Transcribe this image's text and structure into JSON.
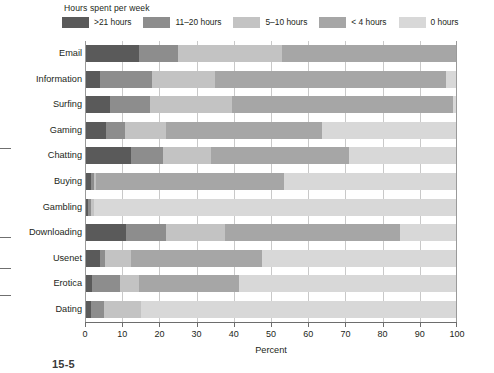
{
  "legend": {
    "title": "Hours spent per week",
    "items": [
      {
        "label": ">21 hours",
        "color": "#5a5a5a",
        "key": "gt21"
      },
      {
        "label": "11–20 hours",
        "color": "#8d8d8d",
        "key": "h11_20"
      },
      {
        "label": "5–10 hours",
        "color": "#c3c3c3",
        "key": "h5_10"
      },
      {
        "label": "< 4 hours",
        "color": "#a6a6a6",
        "key": "lt4"
      },
      {
        "label": "0 hours",
        "color": "#d8d8d8",
        "key": "zero"
      }
    ]
  },
  "axis": {
    "x_label": "Percent",
    "x_ticks": [
      "0",
      "10",
      "20",
      "30",
      "40",
      "50",
      "60",
      "70",
      "80",
      "90",
      "100"
    ],
    "x_min": 0,
    "x_max": 100
  },
  "caption": "15-5",
  "chart_data": {
    "type": "bar",
    "orientation": "horizontal",
    "stacked": true,
    "title": "Hours spent per week",
    "xlabel": "Percent",
    "ylabel": "",
    "xlim": [
      0,
      100
    ],
    "grid": true,
    "legend_position": "top",
    "categories": [
      "Email",
      "Information",
      "Surfing",
      "Gaming",
      "Chatting",
      "Buying",
      "Gambling",
      "Downloading",
      "Usenet",
      "Erotica",
      "Dating"
    ],
    "series": [
      {
        "name": ">21 hours",
        "color": "#5a5a5a",
        "values": [
          14.5,
          4.0,
          6.7,
          5.6,
          12.4,
          1.5,
          0.8,
          11.0,
          4.0,
          2.0,
          1.5
        ]
      },
      {
        "name": "11–20 hours",
        "color": "#8d8d8d",
        "values": [
          10.5,
          14.0,
          10.8,
          5.1,
          8.6,
          1.0,
          0.7,
          10.8,
          1.5,
          7.5,
          3.5
        ]
      },
      {
        "name": "5–10 hours",
        "color": "#c3c3c3",
        "values": [
          28.0,
          17.0,
          22.0,
          11.1,
          13.0,
          0.5,
          1.0,
          15.8,
          7.0,
          5.0,
          10.0
        ]
      },
      {
        "name": "< 4 hours",
        "color": "#a6a6a6",
        "values": [
          47.0,
          62.0,
          59.5,
          41.9,
          37.0,
          50.5,
          0.0,
          47.1,
          35.0,
          27.0,
          0.0
        ]
      },
      {
        "name": "0 hours",
        "color": "#d8d8d8",
        "values": [
          0.0,
          3.0,
          1.0,
          36.3,
          29.0,
          46.5,
          97.5,
          15.3,
          52.5,
          58.5,
          85.0
        ]
      }
    ]
  }
}
